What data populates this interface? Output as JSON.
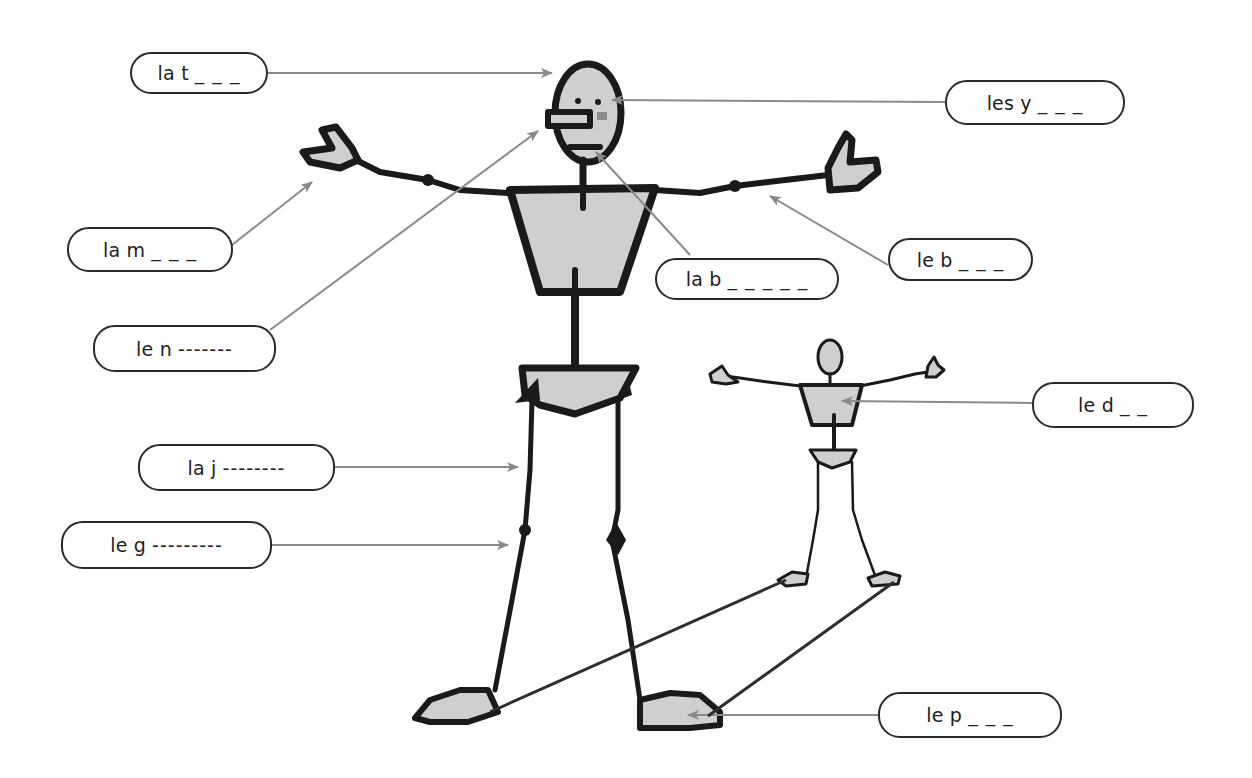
{
  "diagram": {
    "type": "labeled-body-parts-worksheet",
    "language": "French",
    "colors": {
      "outline": "#1a1a1a",
      "fill": "#cfcfcf",
      "arrow": "#8a8a8a",
      "pointer_line": "#2e2e2e",
      "label_border": "#2a2a2a",
      "cheek": "#8c8c8c"
    },
    "labels": [
      {
        "id": "tete",
        "prefix": "la t",
        "blanks": "_ _ _",
        "target": "head"
      },
      {
        "id": "yeux",
        "prefix": "les y",
        "blanks": "_ _ _",
        "target": "eyes"
      },
      {
        "id": "main",
        "prefix": "la m",
        "blanks": "_ _ _",
        "target": "hand"
      },
      {
        "id": "bouche",
        "prefix": "la b",
        "blanks": "_ _ _ _ _",
        "target": "mouth"
      },
      {
        "id": "bras",
        "prefix": "le b",
        "blanks": "_ _ _",
        "target": "arm"
      },
      {
        "id": "nez",
        "prefix": "le n",
        "blanks": "-------",
        "target": "nose"
      },
      {
        "id": "dos",
        "prefix": "le d",
        "blanks": "_ _",
        "target": "back"
      },
      {
        "id": "jambe",
        "prefix": "la j",
        "blanks": "--------",
        "target": "leg"
      },
      {
        "id": "genou",
        "prefix": "le g",
        "blanks": "---------",
        "target": "knee"
      },
      {
        "id": "pied",
        "prefix": "le p",
        "blanks": "_ _ _",
        "target": "foot"
      }
    ]
  }
}
